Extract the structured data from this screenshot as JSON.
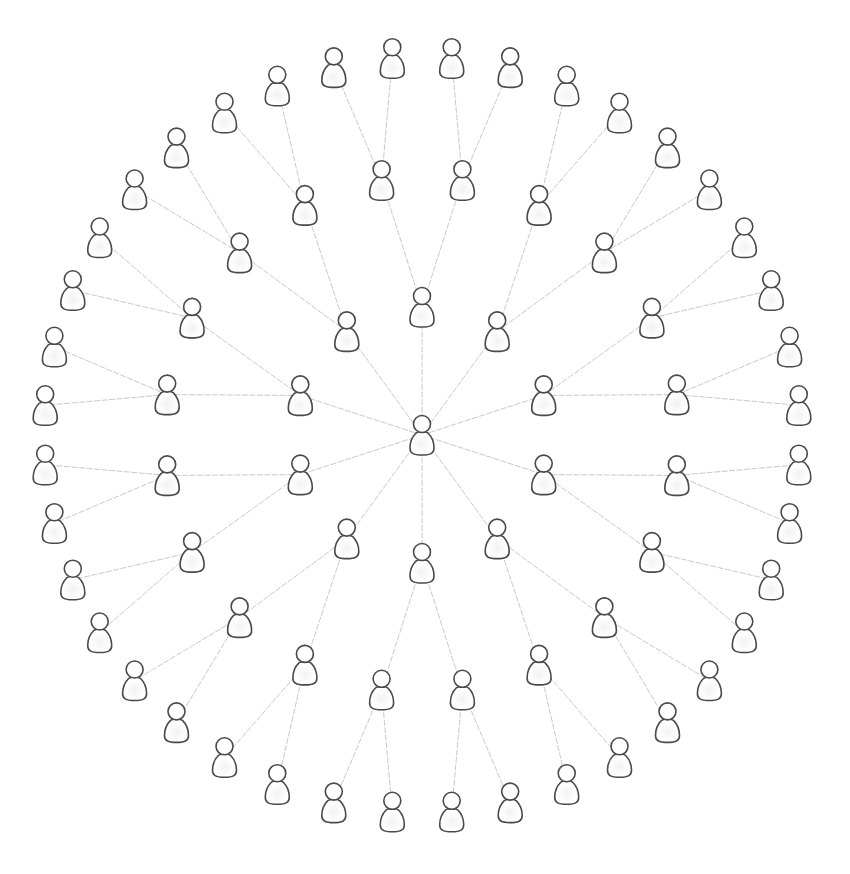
{
  "diagram": {
    "type": "radial-tree",
    "node_icon": "person-icon",
    "colors": {
      "background": "#ffffff",
      "edge": "#c9c9c9",
      "icon_stroke": "#4a4a4a",
      "icon_fill": "#ffffff"
    },
    "levels": [
      {
        "level": 0,
        "count": 1,
        "children_per_node": 10
      },
      {
        "level": 1,
        "count": 10,
        "children_per_node": 2
      },
      {
        "level": 2,
        "count": 20,
        "children_per_node": 2
      },
      {
        "level": 3,
        "count": 40,
        "children_per_node": 0
      }
    ],
    "total_nodes": 71,
    "total_edges": 70
  }
}
